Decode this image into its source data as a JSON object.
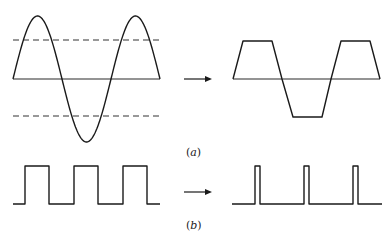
{
  "figure": {
    "panel_a": {
      "label": "(a)",
      "label_letter": "a",
      "input_signal": "sine-wave",
      "clipping_levels": "upper and lower dashed threshold lines",
      "output_signal": "clipped sine (trapezoidal) wave",
      "cycles": 1.5
    },
    "panel_b": {
      "label": "(b)",
      "label_letter": "b",
      "input_signal": "square-wave",
      "output_signal": "narrow pulse train",
      "pulse_count": 3
    },
    "arrow_icon": "right-arrow-icon",
    "colors": {
      "stroke": "#1a1a1a",
      "background": "#ffffff"
    }
  }
}
